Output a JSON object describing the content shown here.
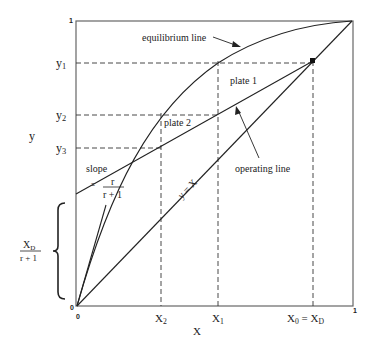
{
  "figure": {
    "type": "McCabe-Thiele diagram",
    "x_axis_label": "X",
    "y_axis_label": "y",
    "corner_labels": {
      "origin_x": "0",
      "origin_y": "0",
      "x_max": "1",
      "y_max": "1"
    },
    "x_ticks": [
      {
        "label": "X",
        "sub": "2",
        "pos": 161
      },
      {
        "label": "X",
        "sub": "1",
        "pos": 218
      },
      {
        "label": "X",
        "sub": "0",
        "suffix": " = X",
        "suffix_sub": "D",
        "pos": 313
      }
    ],
    "y_ticks": [
      {
        "label": "y",
        "sub": "1",
        "pos": 63
      },
      {
        "label": "y",
        "sub": "2",
        "pos": 115
      },
      {
        "label": "y",
        "sub": "3",
        "pos": 148
      }
    ],
    "annotations": {
      "equilibrium_line": "equilibrium line",
      "operating_line": "operating line",
      "diagonal": "y = X",
      "plate1": "plate 1",
      "plate2": "plate 2",
      "slope_word": "slope",
      "slope_eq": "=",
      "slope_num": "r",
      "slope_den": "r + 1",
      "intercept_num": "X",
      "intercept_num_sub": "D",
      "intercept_den": "r + 1"
    },
    "colors": {
      "ink": "#222222",
      "frame": "#555555",
      "background": "#ffffff"
    }
  }
}
